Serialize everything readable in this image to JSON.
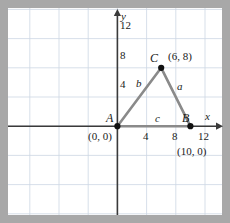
{
  "figure": {
    "colors": {
      "background": "#a8a8a8",
      "plot": "#ffffff",
      "grid": "#cdd7e3",
      "axis": "#3a3a3a",
      "triangle": "#8a8a8a",
      "point": "#111111",
      "text": "#1a1a1a"
    },
    "axes": {
      "x_label": "x",
      "y_label": "y",
      "x_ticks": [
        "4",
        "8",
        "12"
      ],
      "y_ticks": [
        "4",
        "8",
        "12"
      ],
      "x_tick_values": [
        4,
        8,
        12
      ],
      "y_tick_values": [
        4,
        8,
        12
      ]
    },
    "vertices": [
      {
        "name": "A",
        "coord_label": "(0, 0)",
        "x": 0,
        "y": 0
      },
      {
        "name": "B",
        "coord_label": "(10, 0)",
        "x": 10,
        "y": 0
      },
      {
        "name": "C",
        "coord_label": "(6, 8)",
        "x": 6,
        "y": 8
      }
    ],
    "sides": [
      {
        "name": "a",
        "from": "B",
        "to": "C"
      },
      {
        "name": "b",
        "from": "A",
        "to": "C"
      },
      {
        "name": "c",
        "from": "A",
        "to": "B"
      }
    ]
  }
}
